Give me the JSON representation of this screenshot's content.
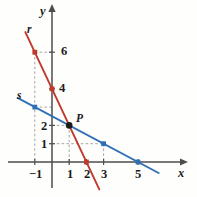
{
  "figure": {
    "title": "",
    "background_color": "#fefefd"
  },
  "chart_data": {
    "type": "line",
    "title": "",
    "xlabel": "x",
    "ylabel": "y",
    "xlim": [
      -1.7,
      6.4
    ],
    "ylim": [
      -1.2,
      7.4
    ],
    "grid": false,
    "legend_position": "inline-line-labels",
    "x_ticks": [
      -1,
      1,
      2,
      3,
      5
    ],
    "x_tick_labels": [
      "−1",
      "1",
      "2",
      "3",
      "5"
    ],
    "y_ticks": [
      1,
      2,
      4,
      6
    ],
    "y_tick_labels": [
      "1",
      "2",
      "4",
      "6"
    ],
    "series": [
      {
        "name": "r",
        "color": "#c0392b",
        "equation": "y = -2x + 4",
        "slope": -2,
        "intercept": 4,
        "marker_color": "#c0392b",
        "points": [
          {
            "x": -1,
            "y": 6
          },
          {
            "x": 0,
            "y": 4
          },
          {
            "x": 2,
            "y": 0
          }
        ],
        "draw_from": {
          "x": -1.55,
          "y": 7.1
        },
        "draw_to": {
          "x": 2.75,
          "y": -1.5
        }
      },
      {
        "name": "s",
        "color": "#2f6fb5",
        "equation": "y = -0.5x + 2.5",
        "slope": -0.5,
        "intercept": 2.5,
        "marker_color": "#2f6fb5",
        "points": [
          {
            "x": -1,
            "y": 3
          },
          {
            "x": 3,
            "y": 1
          },
          {
            "x": 5,
            "y": 0
          }
        ],
        "draw_from": {
          "x": -2.0,
          "y": 3.5
        },
        "draw_to": {
          "x": 6.2,
          "y": -0.6
        }
      }
    ],
    "annotations": [
      {
        "name": "point-p",
        "label": "P",
        "x": 1,
        "y": 2,
        "color": "#1b1b1b"
      }
    ],
    "line_labels": [
      {
        "name": "r",
        "text": "r",
        "x": -1.35,
        "y": 7.25
      },
      {
        "name": "s",
        "text": "s",
        "x": -1.85,
        "y": 3.9
      }
    ],
    "guides": [
      {
        "from": {
          "x": -1,
          "y": 6
        },
        "to": {
          "x": 0,
          "y": 6
        }
      },
      {
        "from": {
          "x": -1,
          "y": 6
        },
        "to": {
          "x": -1,
          "y": 0
        }
      },
      {
        "from": {
          "x": -1,
          "y": 3
        },
        "to": {
          "x": 0,
          "y": 3
        }
      },
      {
        "from": {
          "x": 0,
          "y": 2
        },
        "to": {
          "x": 1,
          "y": 2
        }
      },
      {
        "from": {
          "x": 0,
          "y": 1
        },
        "to": {
          "x": 3,
          "y": 1
        }
      },
      {
        "from": {
          "x": 1,
          "y": 2
        },
        "to": {
          "x": 1,
          "y": 0
        }
      },
      {
        "from": {
          "x": 3,
          "y": 1
        },
        "to": {
          "x": 3,
          "y": 0
        }
      }
    ]
  },
  "axes": {
    "x_axis_label": "x",
    "y_axis_label": "y",
    "axis_color": "#4d4d4d",
    "origin_px": {
      "x": 52,
      "y": 162
    },
    "unit_px": {
      "x": 17.2,
      "y": 18.3
    }
  },
  "colors": {
    "line_r": "#c0392b",
    "line_s": "#2f6fb5",
    "axis": "#4d4d4d",
    "guide": "#9a9a9a",
    "point": "#161616",
    "text": "#1b1b1b"
  }
}
